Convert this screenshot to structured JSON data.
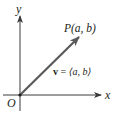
{
  "diagram": {
    "type": "vector-in-coordinate-plane",
    "axes": {
      "x_label": "x",
      "y_label": "y",
      "origin_label": "O"
    },
    "point": {
      "label": "P(a, b)"
    },
    "vector": {
      "label_symbol": "v",
      "label_equals": " = ",
      "label_components": "⟨a, b⟩",
      "label_full": "v = ⟨a, b⟩"
    },
    "colors": {
      "axis": "#3a3a3a",
      "vector": "#5a5a5a",
      "text": "#231f20",
      "background": "#ffffff"
    }
  }
}
